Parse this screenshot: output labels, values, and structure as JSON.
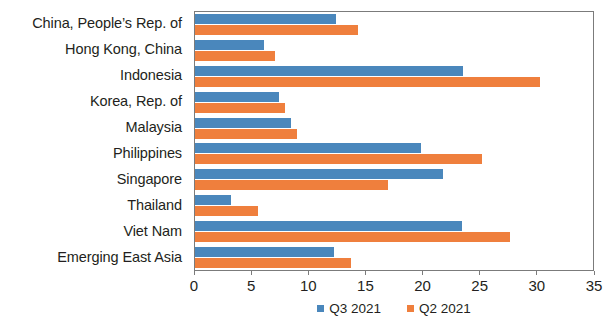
{
  "chart_data": {
    "type": "bar",
    "orientation": "horizontal",
    "title": "",
    "subtitle": "",
    "xlabel": "",
    "ylabel": "",
    "xlim": [
      0,
      35
    ],
    "xticks": [
      0,
      5,
      10,
      15,
      20,
      25,
      30,
      35
    ],
    "xtick_labels": [
      "0",
      "5",
      "10",
      "15",
      "20",
      "25",
      "30",
      "35"
    ],
    "grid": false,
    "legend_position": "bottom-center",
    "categories": [
      "China, People’s Rep. of",
      "Hong Kong, China",
      "Indonesia",
      "Korea, Rep. of",
      "Malaysia",
      "Philippines",
      "Singapore",
      "Thailand",
      "Viet Nam",
      "Emerging East Asia"
    ],
    "series": [
      {
        "name": "Q3 2021",
        "color": "#4a87bc",
        "values": [
          12.4,
          6.1,
          23.6,
          7.4,
          8.4,
          19.9,
          21.8,
          3.2,
          23.5,
          12.2
        ]
      },
      {
        "name": "Q2 2021",
        "color": "#ef7f3d",
        "values": [
          14.3,
          7.0,
          30.3,
          7.9,
          9.0,
          25.2,
          17.0,
          5.5,
          27.7,
          13.7
        ]
      }
    ]
  },
  "legend": {
    "items": [
      {
        "label": "Q3 2021",
        "color": "#4a87bc"
      },
      {
        "label": "Q2 2021",
        "color": "#ef7f3d"
      }
    ]
  }
}
